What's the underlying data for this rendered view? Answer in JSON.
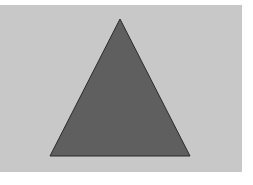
{
  "diagram": {
    "background": {
      "x": 0,
      "y": 5,
      "width": 242,
      "height": 167,
      "color": "#c8c8c8"
    },
    "shapes": [
      {
        "type": "triangle",
        "points": [
          [
            120,
            19
          ],
          [
            190,
            156
          ],
          [
            50,
            156
          ]
        ],
        "fill": "#5f5f5f",
        "stroke": "#2a2a2a",
        "stroke_width": 1
      }
    ]
  }
}
